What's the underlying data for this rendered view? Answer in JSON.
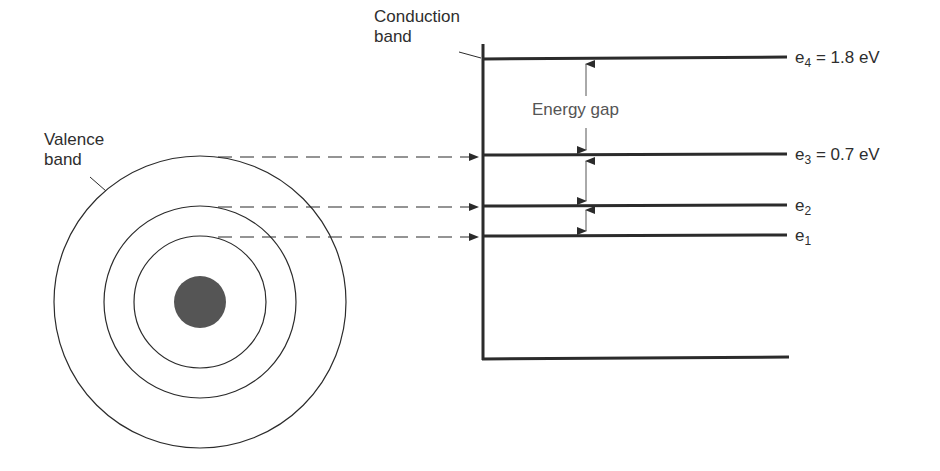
{
  "diagram": {
    "type": "energy-band-diagram",
    "labels": {
      "conduction_band_line1": "Conduction",
      "conduction_band_line2": "band",
      "valence_band_line1": "Valence",
      "valence_band_line2": "band",
      "energy_gap": "Energy gap"
    },
    "levels": [
      {
        "symbol": "e",
        "subscript": "4",
        "value_text": " = 1.8 eV",
        "y": 57
      },
      {
        "symbol": "e",
        "subscript": "3",
        "value_text": " = 0.7 eV",
        "y": 154
      },
      {
        "symbol": "e",
        "subscript": "2",
        "value_text": "",
        "y": 205
      },
      {
        "symbol": "e",
        "subscript": "1",
        "value_text": "",
        "y": 235
      }
    ],
    "atom": {
      "center": [
        200,
        302
      ],
      "orbit_radii": [
        66,
        96,
        146
      ],
      "nucleus_radius": 26,
      "nucleus_color": "#555555"
    },
    "colors": {
      "line": "#2b2b2b",
      "text": "#2e2e2e"
    }
  }
}
